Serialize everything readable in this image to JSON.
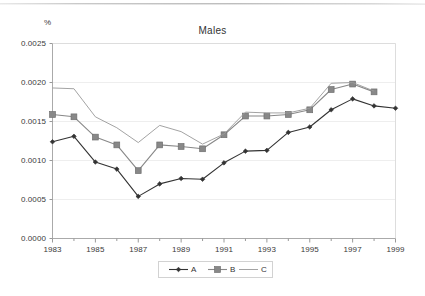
{
  "chart_data": {
    "type": "line",
    "title": "Males",
    "xlabel": "",
    "ylabel": "%",
    "ylim": [
      0.0,
      0.0025
    ],
    "xlim": [
      1983,
      1999
    ],
    "grid": true,
    "legend_position": "bottom",
    "y_ticks": [
      "0.0000",
      "0.0005",
      "0.0010",
      "0.0015",
      "0.0020",
      "0.0025"
    ],
    "y_tick_values": [
      0.0,
      0.0005,
      0.001,
      0.0015,
      0.002,
      0.0025
    ],
    "x_ticks": [
      "1983",
      "1985",
      "1987",
      "1989",
      "1991",
      "1993",
      "1995",
      "1997",
      "1999"
    ],
    "x_tick_values": [
      1983,
      1985,
      1987,
      1989,
      1991,
      1993,
      1995,
      1997,
      1999
    ],
    "x_all_years": [
      1983,
      1984,
      1985,
      1986,
      1987,
      1988,
      1989,
      1990,
      1991,
      1992,
      1993,
      1994,
      1995,
      1996,
      1997,
      1998,
      1999
    ],
    "series": [
      {
        "name": "A",
        "marker": "diamond",
        "color": "#333333",
        "x": [
          1983,
          1984,
          1985,
          1986,
          1987,
          1988,
          1989,
          1990,
          1991,
          1992,
          1993,
          1994,
          1995,
          1996,
          1997,
          1998,
          1999
        ],
        "values": [
          0.00124,
          0.00131,
          0.00098,
          0.00089,
          0.00054,
          0.0007,
          0.00077,
          0.00076,
          0.00097,
          0.00112,
          0.00113,
          0.00136,
          0.00143,
          0.00165,
          0.00179,
          0.0017,
          0.00167
        ]
      },
      {
        "name": "B",
        "marker": "square",
        "color": "#888888",
        "x": [
          1983,
          1984,
          1985,
          1986,
          1987,
          1988,
          1989,
          1990,
          1991,
          1992,
          1993,
          1994,
          1995,
          1996,
          1997,
          1998
        ],
        "values": [
          0.00159,
          0.00156,
          0.0013,
          0.0012,
          0.00087,
          0.0012,
          0.00118,
          0.00115,
          0.00133,
          0.00157,
          0.00157,
          0.00159,
          0.00165,
          0.00191,
          0.00198,
          0.00188
        ]
      },
      {
        "name": "C",
        "marker": "none",
        "color": "#999999",
        "x": [
          1983,
          1984,
          1985,
          1986,
          1987,
          1988,
          1989,
          1990,
          1991,
          1992,
          1993,
          1994,
          1995,
          1996,
          1997,
          1998
        ],
        "values": [
          0.00193,
          0.00192,
          0.00156,
          0.00142,
          0.00123,
          0.00145,
          0.00137,
          0.00121,
          0.00134,
          0.00162,
          0.00161,
          0.00161,
          0.00167,
          0.00199,
          0.002,
          0.00189
        ]
      }
    ]
  },
  "legend": {
    "items": [
      {
        "label": "A"
      },
      {
        "label": "B"
      },
      {
        "label": "C"
      }
    ]
  },
  "axis": {
    "y_unit_label": "%"
  }
}
